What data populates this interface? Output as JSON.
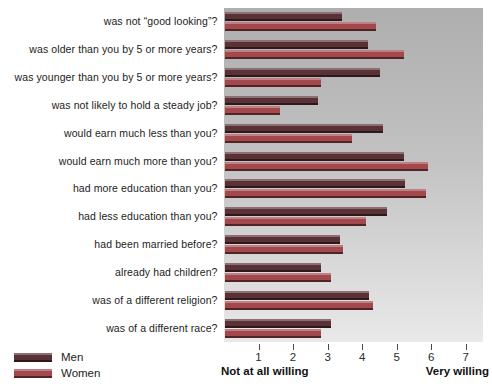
{
  "chart_data": {
    "type": "bar",
    "orientation": "horizontal",
    "categories": [
      "was not “good looking”?",
      "was older than you by 5 or more years?",
      "was younger than you by 5 or more years?",
      "was not likely to hold a steady job?",
      "would earn much less than you?",
      "would earn much more than you?",
      "had more education than you?",
      "had less education than you?",
      "had been married before?",
      "already had children?",
      "was of a different religion?",
      "was of a different race?"
    ],
    "series": [
      {
        "name": "Men",
        "color": "#5a3236",
        "values": [
          3.4,
          4.15,
          4.5,
          2.7,
          4.6,
          5.2,
          5.25,
          4.7,
          3.35,
          2.8,
          4.2,
          3.1
        ]
      },
      {
        "name": "Women",
        "color": "#a3494d",
        "values": [
          4.4,
          5.2,
          2.8,
          1.6,
          3.7,
          5.9,
          5.85,
          4.1,
          3.45,
          3.1,
          4.3,
          2.8
        ]
      }
    ],
    "x_ticks": [
      1,
      2,
      3,
      4,
      5,
      6,
      7
    ],
    "x_axis_min_label": "Not at all willing",
    "x_axis_max_label": "Very willing",
    "x_scale_max": 7.5,
    "legend_position": "bottom-left",
    "grid": false,
    "plot_background_top": "#aeaeae",
    "plot_background_bottom": "#e9e9e9"
  }
}
